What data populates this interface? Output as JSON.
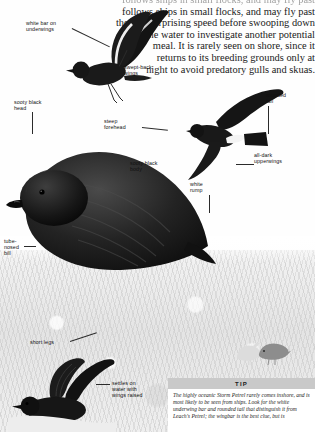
{
  "page": {
    "species": "Storm Petrel",
    "body_text": {
      "clipped_top_line": "follows ships in small flocks, and may fly past",
      "lines": [
        "follows ships in small flocks, and may fly past",
        "them at surprising speed before swooping down",
        "to the water to investigate another potential",
        "meal. It is rarely seen on shore, since it",
        "returns to its breeding grounds only at",
        "night to avoid predatory gulls and skuas."
      ]
    }
  },
  "labels": [
    {
      "id": "white-bar-on-underwings",
      "text": "white bar on\nunderwings"
    },
    {
      "id": "swept-back-wings",
      "text": "swept-back\nwings"
    },
    {
      "id": "sooty-black-head",
      "text": "sooty black\nhead"
    },
    {
      "id": "steep-forehead",
      "text": "steep\nforehead"
    },
    {
      "id": "rounded-tail",
      "text": "rounded\ntail"
    },
    {
      "id": "all-dark-upperwings",
      "text": "all-dark\nupperwings"
    },
    {
      "id": "sooty-black-body",
      "text": "sooty black\nbody"
    },
    {
      "id": "white-rump",
      "text": "white\nrump"
    },
    {
      "id": "tube-nosed-bill",
      "text": "tube-\nnosed\nbill"
    },
    {
      "id": "short-legs",
      "text": "short legs"
    },
    {
      "id": "settles-on-water",
      "text": "settles on\nwater with\nwings raised"
    }
  ],
  "tip": {
    "heading": "TIP",
    "text": "The highly oceanic Storm Petrel rarely comes inshore, and is most likely to be seen from ships. Look for the white underwing bar and rounded tail that distinguish it from Leach's Petrel; the wingbar is the best clue, but is"
  },
  "colors": {
    "tip_header_bg": "#c9c9c9",
    "plumage_dark": "#1c1c1c",
    "rump_white": "#f2f2f2",
    "text": "#111111"
  }
}
